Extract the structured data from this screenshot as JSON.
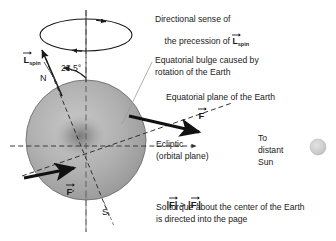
{
  "figure": {
    "background_color": "#ffffff",
    "earth_color": "#a9a9a9",
    "line_color": "#1a1a1a",
    "sun_color": "#cfcfcf"
  },
  "labels": {
    "precession_line1": "Directional sense of",
    "precession_line2_pre": "the precession of ",
    "precession_line2_vec": "L",
    "precession_line2_sub": "spin",
    "bulge_line1": "Equatorial bulge caused by",
    "bulge_line2": "rotation of the Earth",
    "equatorial_plane": "Equatorial plane of the Earth",
    "ecliptic_line1": "Ecliptic",
    "ecliptic_line2": "(orbital plane)",
    "sun_line1": "To",
    "sun_line2": "distant",
    "sun_line3": "Sun",
    "tilt_angle": "23.5°",
    "pole_north": "N",
    "pole_south": "S",
    "L_spin_vec": "L",
    "L_spin_sub": "spin",
    "force_F": "F",
    "force_Fprime": "F",
    "force_Fprime_mark": "′",
    "magnitude_F": "F",
    "magnitude_gt": " > ",
    "magnitude_Fp": "F",
    "magnitude_Fp_mark": "′",
    "magnitude_bar": "|",
    "torque_line1": "So torque about the center of the Earth",
    "torque_line2": "is directed into the page"
  },
  "icons": {
    "earth_sphere": "earth-sphere-icon",
    "sun_disc": "sun-disc-icon",
    "precession_ellipse": "precession-ellipse-icon",
    "spin_axis": "spin-axis-icon",
    "force_arrow_near": "force-arrow-near-icon",
    "force_arrow_far": "force-arrow-far-icon",
    "ecliptic_dashed_line": "ecliptic-dashed-line-icon",
    "equatorial_dashed_line": "equatorial-dashed-line-icon",
    "angle_arc": "angle-arc-icon",
    "leader_line_bulge": "leader-line-icon"
  }
}
